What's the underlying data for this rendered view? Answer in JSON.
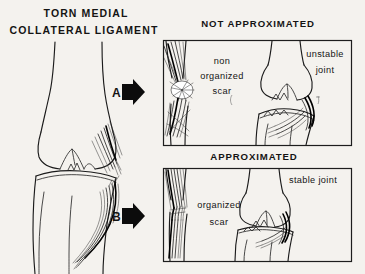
{
  "figure": {
    "title_line1": "TORN MEDIAL",
    "title_line2": "COLLATERAL LIGAMENT",
    "background_color": "#f4f2ee",
    "ink_color": "#141414"
  },
  "steps": [
    {
      "letter": "A",
      "arrow_icon": "right-arrow-icon"
    },
    {
      "letter": "B",
      "arrow_icon": "right-arrow-icon"
    }
  ],
  "panels": [
    {
      "id": "not-approximated",
      "title": "NOT APPROXIMATED",
      "labels": [
        {
          "id": "scar",
          "line1": "non",
          "line2": "organized",
          "line3": "scar"
        },
        {
          "id": "joint",
          "line1": "unstable",
          "line2": "joint"
        }
      ]
    },
    {
      "id": "approximated",
      "title": "APPROXIMATED",
      "labels": [
        {
          "id": "scar",
          "line1": "organized",
          "line2": "scar"
        },
        {
          "id": "joint",
          "line1": "stable joint"
        }
      ]
    }
  ]
}
